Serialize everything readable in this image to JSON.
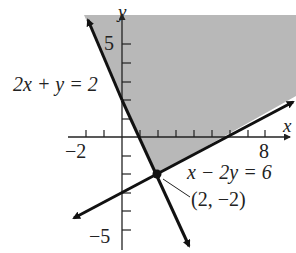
{
  "diagram": {
    "type": "linear-inequality-graph",
    "colors": {
      "shade": "#b8b8b8",
      "line": "#111111",
      "axis": "#222222",
      "background": "#ffffff"
    },
    "axes": {
      "x_label": "x",
      "y_label": "y",
      "x_ticks_labeled": [
        "-2",
        "8"
      ],
      "y_ticks_labeled": [
        "5",
        "-5"
      ],
      "x_range": [
        -3,
        9
      ],
      "y_range": [
        -6,
        6
      ]
    },
    "lines": [
      {
        "equation": "2x + y = 2"
      },
      {
        "equation": "x − 2y = 6"
      }
    ],
    "point": {
      "label": "(2, −2)"
    },
    "labels": {
      "line1": "2x + y = 2",
      "line2": "x − 2y = 6",
      "point": "(2, −2)",
      "x_axis": "x",
      "y_axis": "y",
      "tick_neg2": "−2",
      "tick_8": "8",
      "tick_5": "5",
      "tick_neg5": "−5"
    }
  }
}
